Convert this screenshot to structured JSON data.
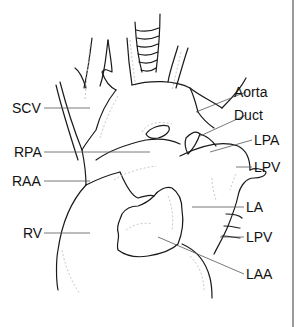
{
  "figure": {
    "labels": {
      "scv": "SCV",
      "rpa": "RPA",
      "raa": "RAA",
      "rv": "RV",
      "aorta": "Aorta",
      "duct": "Duct",
      "lpa": "LPA",
      "lpv_upper": "LPV",
      "la": "LA",
      "lpv_lower": "LPV",
      "laa": "LAA"
    }
  },
  "colors": {
    "background": "#ffffff",
    "outline": "#1a1a1a",
    "leader": "#555555",
    "text": "#111111",
    "border": "#9a9a9a"
  }
}
